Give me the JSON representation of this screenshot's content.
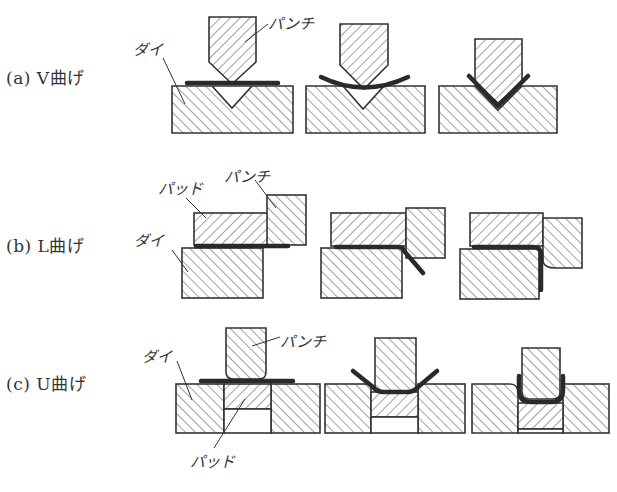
{
  "figure": {
    "rows": [
      {
        "id": "a",
        "label": "(a) V曲げ",
        "process": "V bending",
        "parts": {
          "punch": "パンチ",
          "die": "ダイ"
        },
        "stages": 3
      },
      {
        "id": "b",
        "label": "(b) L曲げ",
        "process": "L bending",
        "parts": {
          "pad": "パッド",
          "punch": "パンチ",
          "die": "ダイ"
        },
        "stages": 3
      },
      {
        "id": "c",
        "label": "(c) U曲げ",
        "process": "U bending",
        "parts": {
          "die": "ダイ",
          "punch": "パンチ",
          "pad": "パッド"
        },
        "stages": 3
      }
    ],
    "colors": {
      "outline": "#333333",
      "hatch": "#444444",
      "sheet_metal": "#2a2a2a",
      "background": "#ffffff"
    }
  }
}
